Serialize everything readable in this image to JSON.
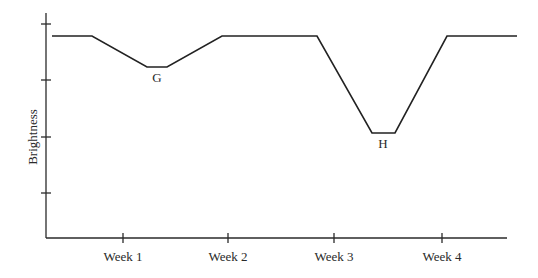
{
  "chart_data": {
    "type": "line",
    "title": "",
    "xlabel": "",
    "ylabel": "Brightness",
    "x_tick_labels": [
      "Week 1",
      "Week 2",
      "Week 3",
      "Week 4"
    ],
    "y_tick_labels": [],
    "grid": false,
    "legend": null,
    "series": [
      {
        "name": "Brightness",
        "points_px": [
          [
            52,
            36
          ],
          [
            92,
            36
          ],
          [
            147,
            67
          ],
          [
            167,
            67
          ],
          [
            222,
            36
          ],
          [
            317,
            36
          ],
          [
            372,
            133
          ],
          [
            395,
            133
          ],
          [
            447,
            36
          ],
          [
            517,
            36
          ]
        ],
        "points_weeks": [
          [
            0.35,
            1.0
          ],
          [
            0.65,
            1.0
          ],
          [
            1.2,
            0.86
          ],
          [
            1.4,
            0.86
          ],
          [
            2.0,
            1.0
          ],
          [
            2.8,
            1.0
          ],
          [
            3.4,
            0.57
          ],
          [
            3.6,
            0.57
          ],
          [
            4.05,
            1.0
          ],
          [
            4.7,
            1.0
          ]
        ]
      }
    ],
    "annotations": [
      {
        "text": "G",
        "x_px": 157,
        "y_px": 82,
        "description": "shallow dip in brightness between Week 1 and Week 2"
      },
      {
        "text": "H",
        "x_px": 383,
        "y_px": 148,
        "description": "deep dip in brightness between Week 3 and Week 4"
      }
    ]
  },
  "axes": {
    "y_label": "Brightness",
    "x_ticks": [
      "Week 1",
      "Week 2",
      "Week 3",
      "Week 4"
    ]
  },
  "annotations": {
    "g": "G",
    "h": "H"
  }
}
